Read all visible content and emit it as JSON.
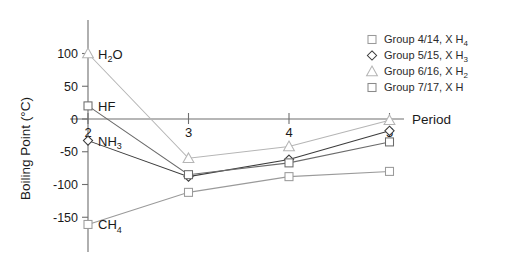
{
  "chart_data": {
    "type": "line",
    "title": "",
    "xlabel": "Period",
    "ylabel": "Boiling Point (°C)",
    "x": [
      2,
      3,
      4,
      5
    ],
    "xticklabels": [
      "2",
      "3",
      "4",
      "5"
    ],
    "yticklabels": [
      "100",
      "50",
      "0",
      "-50",
      "-100",
      "-150"
    ],
    "yticks": [
      100,
      50,
      0,
      -50,
      -100,
      -150
    ],
    "ylim": [
      -175,
      130
    ],
    "xlim": [
      1.72,
      5.28
    ],
    "grid": false,
    "legend_position": "top-right",
    "series": [
      {
        "name": "Group  4/14, XH4",
        "legend_label_main": "Group  4/14, X H",
        "legend_sub": "4",
        "marker": "square",
        "color": "#9a9a9a",
        "values": [
          -161,
          -112,
          -88,
          -80
        ]
      },
      {
        "name": "Group  5/15, XH3",
        "legend_label_main": "Group  5/15, X H",
        "legend_sub": "3",
        "marker": "diamond",
        "color": "#3c3c3c",
        "values": [
          -33,
          -88,
          -62,
          -18
        ]
      },
      {
        "name": "Group  6/16, XH2",
        "legend_label_main": "Group  6/16, X H",
        "legend_sub": "2",
        "marker": "triangle",
        "color": "#b5b5b5",
        "values": [
          100,
          -60,
          -42,
          -2
        ]
      },
      {
        "name": "Group  7/17, XH",
        "legend_label_main": "Group  7/17, X H",
        "legend_sub": "",
        "marker": "square",
        "color": "#6b6b6b",
        "values": [
          20,
          -85,
          -67,
          -35
        ]
      }
    ],
    "annotations": [
      {
        "text_main": "H",
        "sub": "2",
        "text_tail": "O",
        "x": 2,
        "y": 100
      },
      {
        "text_main": "HF",
        "sub": "",
        "text_tail": "",
        "x": 2,
        "y": 20
      },
      {
        "text_main": "NH",
        "sub": "3",
        "text_tail": "",
        "x": 2,
        "y": -33
      },
      {
        "text_main": "CH",
        "sub": "4",
        "text_tail": "",
        "x": 2,
        "y": -161
      }
    ]
  },
  "axis": {
    "y_title": "Boiling Point  (°C)",
    "x_title": "Period",
    "yticks": [
      "100",
      "50",
      "0",
      "-50",
      "-100",
      "-150"
    ],
    "xticks": [
      "2",
      "3",
      "4",
      "5"
    ]
  },
  "annotations": {
    "h2o_main": "H",
    "h2o_sub": "2",
    "h2o_tail": "O",
    "hf": "HF",
    "nh3_main": "NH",
    "nh3_sub": "3",
    "ch4_main": "CH",
    "ch4_sub": "4"
  },
  "legend": {
    "items": [
      {
        "main": "Group  4/14, X H",
        "sub": "4",
        "marker": "square-marker",
        "color": "#9a9a9a"
      },
      {
        "main": "Group  5/15, X H",
        "sub": "3",
        "marker": "diamond-marker",
        "color": "#3c3c3c"
      },
      {
        "main": "Group  6/16, X H",
        "sub": "2",
        "marker": "triangle-marker",
        "color": "#b5b5b5"
      },
      {
        "main": "Group  7/17, X H",
        "sub": "",
        "marker": "square-marker",
        "color": "#8a8a8a"
      }
    ]
  }
}
